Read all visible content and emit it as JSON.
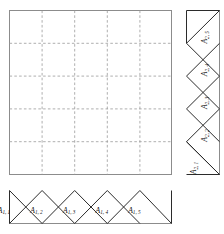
{
  "figure": {
    "type": "finite-element-basis-function-diagram",
    "background_color": "#ffffff",
    "line_color": "#2b2b2b",
    "grid_color": "#9a9a9a",
    "border_color": "#8c8c8c",
    "domain_square": {
      "name": "tensor-product-grid",
      "x": 9,
      "y": 10,
      "width": 163,
      "height": 165,
      "cells_x": 5,
      "cells_y": 5,
      "internal_lines_x": 4,
      "internal_lines_y": 4,
      "grid_style": "dashed"
    },
    "bottom_strip": {
      "name": "x1-hat-functions",
      "orientation": "horizontal",
      "x": 9,
      "y": 190,
      "width": 163,
      "height": 34,
      "count": 5,
      "labels": [
        "A_1,1",
        "A_1,2",
        "A_1,3",
        "A_1,4",
        "A_1,5"
      ],
      "label_bases": [
        "A",
        "A",
        "A",
        "A",
        "A"
      ],
      "label_subs": [
        "1, 1",
        "1, 2",
        "1, 3",
        "1, 4",
        "1, 5"
      ]
    },
    "right_strip": {
      "name": "x2-hat-functions",
      "orientation": "vertical",
      "x": 186,
      "y": 10,
      "width": 34,
      "height": 165,
      "count": 5,
      "labels": [
        "A_2,1",
        "A_2,2",
        "A_2,3",
        "A_2,4",
        "A_2,5"
      ],
      "label_bases": [
        "A",
        "A",
        "A",
        "A",
        "A"
      ],
      "label_subs": [
        "2, 1",
        "2, 2",
        "2, 3",
        "2, 4",
        "2, 5"
      ],
      "label_rotation_deg": -90,
      "order_bottom_to_top": true
    }
  }
}
